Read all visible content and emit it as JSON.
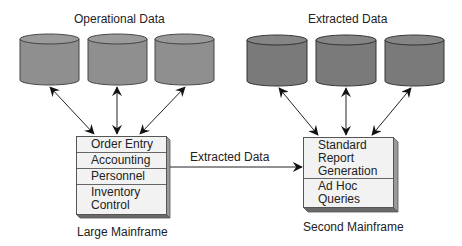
{
  "diagram": {
    "left_group": {
      "title": "Operational Data",
      "cylinder_count": 3,
      "cylinder_color": "#8f8f8f",
      "mainframe": {
        "label": "Large Mainframe",
        "rows": [
          "Order Entry",
          "Accounting",
          "Personnel",
          "Inventory\nControl"
        ]
      }
    },
    "right_group": {
      "title": "Extracted Data",
      "cylinder_count": 3,
      "cylinder_color": "#7a7a7a",
      "mainframe": {
        "label": "Second Mainframe",
        "rows": [
          "Standard\nReport\nGeneration",
          "Ad Hoc\nQueries"
        ]
      }
    },
    "connector": {
      "label": "Extracted Data",
      "from": "Large Mainframe",
      "to": "Second Mainframe"
    }
  }
}
